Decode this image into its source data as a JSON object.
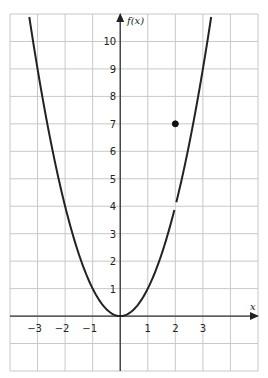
{
  "chart_data": {
    "type": "line",
    "title": "",
    "xlabel": "x",
    "ylabel": "f(x)",
    "xlim": [
      -4,
      5
    ],
    "ylim": [
      -2,
      11
    ],
    "grid": true,
    "x_ticks": [
      -3,
      -2,
      -1,
      1,
      2,
      3
    ],
    "x_tick_labels": [
      "−3",
      "−2",
      "−1",
      "1",
      "2",
      "3"
    ],
    "y_ticks": [
      1,
      2,
      3,
      4,
      5,
      6,
      7,
      8,
      9,
      10
    ],
    "y_tick_labels": [
      "1",
      "2",
      "3",
      "4",
      "5",
      "6",
      "7",
      "8",
      "9",
      "10"
    ],
    "series": [
      {
        "name": "f(x) = x^2 (x ≠ 2)",
        "function": "x^2",
        "domain": [
          -3.3,
          3.3
        ],
        "break_at_x": 2,
        "x": [
          -3.3,
          -3,
          -2,
          -1,
          0,
          1,
          2,
          3,
          3.3
        ],
        "values": [
          10.89,
          9,
          4,
          1,
          0,
          1,
          4,
          9,
          10.89
        ]
      }
    ],
    "points": [
      {
        "name": "isolated point",
        "x": 2,
        "y": 7,
        "filled": true
      }
    ],
    "annotations": [
      "Curve has a gap at (2, 4); filled dot at (2, 7)"
    ]
  }
}
